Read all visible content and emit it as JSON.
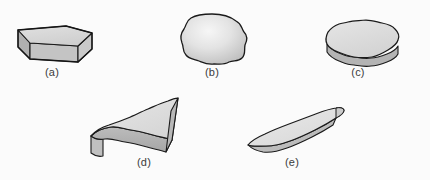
{
  "figure": {
    "background_color": "#fbfbfb",
    "outline_color": "#1a1a1a",
    "label_color": "#3a3a3a",
    "specimens": [
      {
        "id": "a",
        "label": "(a)",
        "name": "angular-blocky-prism",
        "label_x": 52,
        "label_y": 66,
        "top_face_color": "#d8d8d8",
        "front_face_color": "#c0c0c0",
        "left_face_color": "#b0b0b0",
        "right_face_color": "#c8c8c8"
      },
      {
        "id": "b",
        "label": "(b)",
        "name": "rounded-spheroidal-grain",
        "label_x": 212,
        "label_y": 66,
        "fill_center_color": "#f4f4f4",
        "fill_edge_color": "#c4c4c4"
      },
      {
        "id": "c",
        "label": "(c)",
        "name": "wavy-edged-tabular-disc",
        "label_x": 358,
        "label_y": 66,
        "top_face_color": "#dcdcdc",
        "rim_face_color": "#b4b4b4"
      },
      {
        "id": "d",
        "label": "(d)",
        "name": "elongated-wedge-slab",
        "label_x": 144,
        "label_y": 156,
        "top_face_color": "#dedede",
        "side_face_color": "#b2b2b2",
        "end_face_color": "#c6c6c6"
      },
      {
        "id": "e",
        "label": "(e)",
        "name": "thin-blade-platelet",
        "label_x": 292,
        "label_y": 156,
        "top_face_color": "#e2e2e2",
        "side_face_color": "#bcbcbc",
        "end_face_color": "#cccccc"
      }
    ]
  }
}
